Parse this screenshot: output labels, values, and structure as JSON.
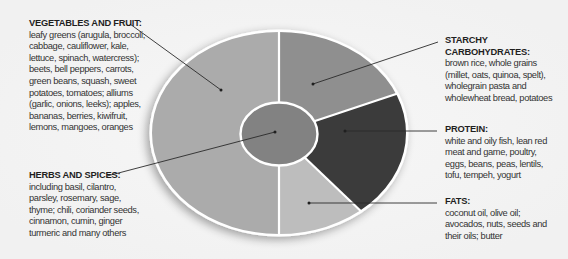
{
  "diagram": {
    "type": "plate-diagram",
    "colors": {
      "background": "#f5f5f5",
      "vegetables_and_fruit": "#ababab",
      "starchy_carbohydrates": "#8f8f8f",
      "protein": "#3b3b3b",
      "fats": "#bdbdbd",
      "herbs_and_spices": "#828282",
      "divider": "#ffffff",
      "leader_line": "#2a2a2a"
    }
  },
  "sections": {
    "vegetables": {
      "title": "VEGETABLES AND FRUIT:",
      "body": "leafy greens (arugula, broccoli,\ncabbage, cauliflower, kale,\nlettuce, spinach, watercress);\nbeets, bell peppers, carrots,\ngreen beans, squash, sweet\npotatoes, tomatoes; alliums\n(garlic, onions, leeks); apples,\nbananas, berries, kiwifruit,\nlemons, mangoes, oranges"
    },
    "herbs": {
      "title": "HERBS AND SPICES:",
      "body": "including basil, cilantro,\nparsley, rosemary, sage,\nthyme; chili, coriander seeds,\ncinnamon, cumin, ginger\nturmeric and many others"
    },
    "starchy": {
      "title": "STARCHY CARBOHYDRATES:",
      "body": "brown rice, whole grains\n(millet, oats, quinoa, spelt),\nwholegrain pasta and\nwholewheat bread, potatoes"
    },
    "protein": {
      "title": "PROTEIN:",
      "body": "white and oily fish, lean red\nmeat and game, poultry,\neggs, beans, peas, lentils,\ntofu, tempeh, yogurt"
    },
    "fats": {
      "title": "FATS:",
      "body": "coconut oil, olive oil;\navocados, nuts, seeds and\ntheir oils; butter"
    }
  }
}
